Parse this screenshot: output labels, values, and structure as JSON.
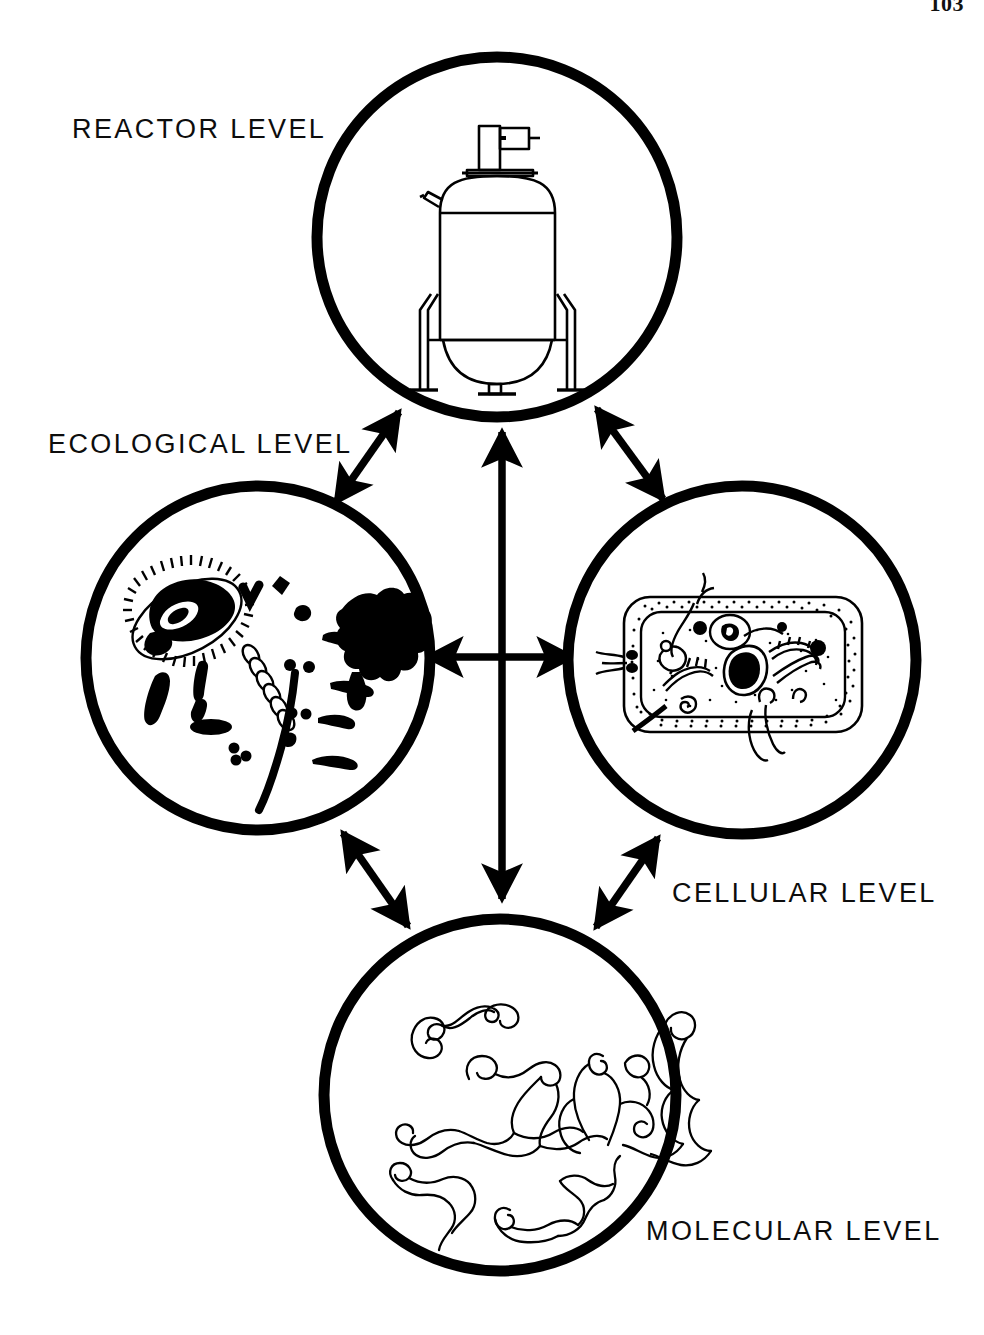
{
  "page": {
    "number": "103",
    "background_color": "#ffffff",
    "ink_color": "#000000"
  },
  "figure": {
    "kind": "concept-diagram",
    "title_visible": false
  },
  "nodes": [
    {
      "id": "reactor",
      "label": "REACTOR  LEVEL",
      "label_position": "upper-left",
      "illustration": "bioreactor-vessel-icon",
      "illustration_description": "Stirred-tank fermenter with top-mounted drive motor, side port, conical dished bottom, bottom drain valve and two support legs",
      "circle": {
        "cx": 497,
        "cy": 237,
        "r": 180
      }
    },
    {
      "id": "ecological",
      "label": "ECOLOGICAL  LEVEL",
      "label_position": "upper-left",
      "illustration": "microbial-community-icon",
      "illustration_description": "Mixed microbial population: one large ciliated protozoan, bacilli, cocci, diplococci, a streptococcal chain, filaments and an irregular floc aggregate",
      "circle": {
        "cx": 258,
        "cy": 658,
        "r": 172
      }
    },
    {
      "id": "cellular",
      "label": "CELLULAR  LEVEL",
      "label_position": "lower-right",
      "illustration": "bacterial-cell-icon",
      "illustration_description": "Cut-away rod-shaped bacterial cell showing stippled cell wall, plasma membrane, nucleoid, ribosomes, mesosome, inclusion bodies and flagella",
      "circle": {
        "cx": 742,
        "cy": 660,
        "r": 174
      }
    },
    {
      "id": "molecular",
      "label": "MOLECULAR  LEVEL",
      "label_position": "lower-right",
      "illustration": "dna-strands-icon",
      "illustration_description": "Tangled, looping biopolymer / nucleic-acid strands drawn as open double-outline filaments",
      "circle": {
        "cx": 500,
        "cy": 1095,
        "r": 176
      }
    }
  ],
  "connections": [
    {
      "id": "reactor-ecological",
      "from": "reactor",
      "to": "ecological",
      "style": "double-headed-arrow",
      "orientation": "diagonal"
    },
    {
      "id": "reactor-cellular",
      "from": "reactor",
      "to": "cellular",
      "style": "double-headed-arrow",
      "orientation": "diagonal"
    },
    {
      "id": "reactor-molecular",
      "from": "reactor",
      "to": "molecular",
      "style": "double-headed-arrow",
      "orientation": "vertical"
    },
    {
      "id": "ecological-cellular",
      "from": "ecological",
      "to": "cellular",
      "style": "double-headed-arrow",
      "orientation": "horizontal"
    },
    {
      "id": "ecological-molecular",
      "from": "ecological",
      "to": "molecular",
      "style": "double-headed-arrow",
      "orientation": "diagonal"
    },
    {
      "id": "cellular-molecular",
      "from": "cellular",
      "to": "molecular",
      "style": "double-headed-arrow",
      "orientation": "diagonal"
    }
  ]
}
